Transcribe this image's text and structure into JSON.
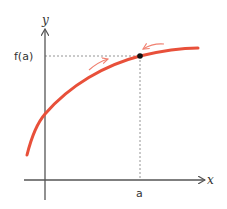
{
  "diagram": {
    "type": "function-graph",
    "labels": {
      "y_axis": "y",
      "x_axis": "x",
      "point_y": "f(a)",
      "point_x": "a"
    },
    "colors": {
      "curve": "#e8503a",
      "approach_arrows": "#f08070",
      "axes": "#555555",
      "guide_lines": "#888888",
      "point": "#111111"
    },
    "elements": {
      "curve": "f(x) increasing, concave down",
      "point": "(a, f(a))",
      "guides": [
        "dotted horizontal from y-axis to point at f(a)",
        "dotted vertical from point to x-axis at a"
      ],
      "approach_arrows": [
        "from left, pointing right along curve",
        "from right, pointing left along curve"
      ]
    }
  }
}
